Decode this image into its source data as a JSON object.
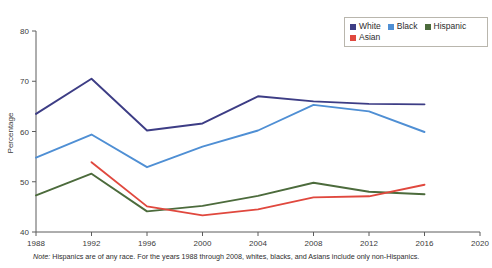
{
  "chart_data": {
    "type": "line",
    "title": "",
    "xlabel": "",
    "ylabel": "Percentage",
    "x": [
      1988,
      1992,
      1996,
      2000,
      2004,
      2008,
      2012,
      2016
    ],
    "xticks": [
      "1988",
      "1992",
      "1996",
      "2000",
      "2004",
      "2008",
      "2012",
      "2016",
      "2020"
    ],
    "xlim": [
      1988,
      2020
    ],
    "yticks": [
      "40",
      "50",
      "60",
      "70",
      "80"
    ],
    "ylim": [
      40,
      80
    ],
    "grid": false,
    "legend_position": "top-right",
    "series": [
      {
        "name": "White",
        "color": "#3d3d85",
        "x": [
          1988,
          1992,
          1996,
          2000,
          2004,
          2008,
          2012,
          2016
        ],
        "values": [
          63.5,
          70.5,
          60.2,
          61.6,
          67.0,
          66.0,
          65.5,
          65.4
        ]
      },
      {
        "name": "Black",
        "color": "#4f8fd4",
        "x": [
          1988,
          1992,
          1996,
          2000,
          2004,
          2008,
          2012,
          2016
        ],
        "values": [
          54.8,
          59.4,
          52.9,
          57.0,
          60.2,
          65.3,
          64.0,
          59.9
        ]
      },
      {
        "name": "Hispanic",
        "color": "#4c6b3c",
        "x": [
          1988,
          1992,
          1996,
          2000,
          2004,
          2008,
          2012,
          2016
        ],
        "values": [
          47.3,
          51.6,
          44.1,
          45.2,
          47.2,
          49.8,
          48.0,
          47.5
        ]
      },
      {
        "name": "Asian",
        "color": "#e0483e",
        "x": [
          1992,
          1996,
          2000,
          2004,
          2008,
          2012,
          2016
        ],
        "values": [
          53.9,
          45.1,
          43.3,
          44.5,
          46.9,
          47.1,
          49.4
        ]
      }
    ]
  },
  "axis": {
    "y_title": "Percentage"
  },
  "legend": {
    "items": [
      {
        "label": "White",
        "color": "#3d3d85"
      },
      {
        "label": "Black",
        "color": "#4f8fd4"
      },
      {
        "label": "Hispanic",
        "color": "#4c6b3c"
      },
      {
        "label": "Asian",
        "color": "#e0483e"
      }
    ]
  },
  "footnote": {
    "note_prefix": "Note:",
    "text": " Hispanics are of any race. For the years 1988 through 2008, whites, blacks, and Asians include only non-Hispanics."
  },
  "colors": {
    "white_series": "#3d3d85",
    "black_series": "#4f8fd4",
    "hispanic_series": "#4c6b3c",
    "asian_series": "#e0483e",
    "axis": "#5c5c5c",
    "text": "#2d2d2d"
  }
}
